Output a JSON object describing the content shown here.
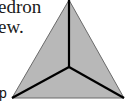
{
  "caption": {
    "line1": "edron",
    "line2": "ew."
  },
  "labels": {
    "vertex_p": "p"
  },
  "figure": {
    "fill_color": "#b8b8b8",
    "edge_color": "#000000",
    "vertices": {
      "apex": [
        69,
        0
      ],
      "center": [
        69,
        67
      ],
      "bottom_left": [
        12,
        98
      ],
      "bottom_right": [
        124,
        98
      ]
    }
  }
}
